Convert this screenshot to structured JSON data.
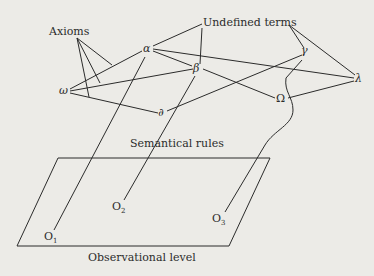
{
  "diagram": {
    "labels": {
      "axioms": "Axioms",
      "undefined_terms": "Undefined terms",
      "semantical_rules": "Semantical rules",
      "observational_level": "Observational level"
    },
    "nodes": {
      "alpha": "α",
      "beta": "β",
      "gamma": "γ",
      "lambda": "λ",
      "omega": "ω",
      "partial": "∂",
      "Omega": "Ω"
    },
    "observations": [
      {
        "base": "O",
        "sub": "1"
      },
      {
        "base": "O",
        "sub": "2"
      },
      {
        "base": "O",
        "sub": "3"
      }
    ],
    "colors": {
      "background": "#ecebe7",
      "ink": "#2b2b2b"
    }
  }
}
